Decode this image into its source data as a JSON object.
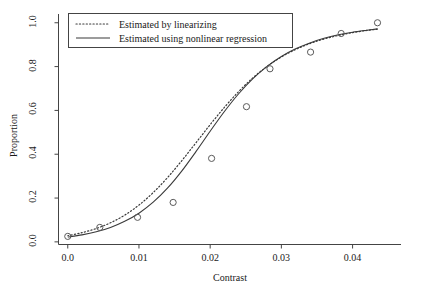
{
  "chart_data": {
    "type": "line",
    "title": "",
    "xlabel": "Contrast",
    "ylabel": "Proportion",
    "xlim": [
      -0.0013,
      0.0468
    ],
    "ylim": [
      -0.012,
      1.04
    ],
    "grid": false,
    "legend_position": "top-left",
    "xticks": [
      "0.0",
      "0.01",
      "0.02",
      "0.03",
      "0.04"
    ],
    "xtick_values": [
      0.0,
      0.01,
      0.02,
      0.03,
      0.04
    ],
    "yticks": [
      "0.0",
      "0.2",
      "0.4",
      "0.6",
      "0.8",
      "1.0"
    ],
    "ytick_values": [
      0.0,
      0.2,
      0.4,
      0.6,
      0.8,
      1.0
    ],
    "points": {
      "name": "Observed proportion",
      "marker": "open-circle",
      "x": [
        0.0,
        0.0045,
        0.0098,
        0.0148,
        0.0202,
        0.0251,
        0.0284,
        0.0341,
        0.0384,
        0.0435
      ],
      "y": [
        0.025,
        0.066,
        0.112,
        0.18,
        0.381,
        0.617,
        0.79,
        0.866,
        0.951,
        1.0
      ]
    },
    "series": [
      {
        "name": "Estimated by linearizing",
        "style": "dotted",
        "color": "#3a3a3a",
        "x": [
          0.0,
          0.002,
          0.004,
          0.006,
          0.008,
          0.01,
          0.012,
          0.014,
          0.016,
          0.018,
          0.02,
          0.022,
          0.024,
          0.026,
          0.028,
          0.03,
          0.032,
          0.034,
          0.036,
          0.038,
          0.04,
          0.042,
          0.0435
        ],
        "y": [
          0.028,
          0.042,
          0.061,
          0.087,
          0.122,
          0.168,
          0.225,
          0.293,
          0.37,
          0.452,
          0.535,
          0.614,
          0.686,
          0.749,
          0.801,
          0.844,
          0.878,
          0.905,
          0.926,
          0.942,
          0.955,
          0.965,
          0.971
        ]
      },
      {
        "name": "Estimated using nonlinear regression",
        "style": "solid",
        "color": "#3a3a3a",
        "x": [
          0.0,
          0.002,
          0.004,
          0.006,
          0.008,
          0.01,
          0.012,
          0.014,
          0.016,
          0.018,
          0.02,
          0.022,
          0.024,
          0.026,
          0.028,
          0.03,
          0.032,
          0.034,
          0.036,
          0.038,
          0.04,
          0.042,
          0.0435
        ],
        "y": [
          0.022,
          0.032,
          0.046,
          0.066,
          0.094,
          0.131,
          0.181,
          0.245,
          0.323,
          0.412,
          0.505,
          0.595,
          0.676,
          0.745,
          0.801,
          0.846,
          0.881,
          0.908,
          0.929,
          0.945,
          0.957,
          0.966,
          0.972
        ]
      }
    ],
    "legend": [
      {
        "label": "Estimated by linearizing",
        "style": "dotted"
      },
      {
        "label": "Estimated using nonlinear regression",
        "style": "solid"
      }
    ]
  }
}
